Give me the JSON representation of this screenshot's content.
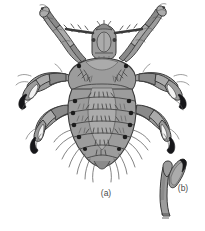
{
  "figure": {
    "kind": "scientific-illustration",
    "background_color": "#ffffff",
    "panels": [
      {
        "id": "a",
        "label": "(a)",
        "caption_x": 106,
        "caption_y": 196,
        "content": "whole louse, dorsal view"
      },
      {
        "id": "b",
        "label": "(b)",
        "caption_x": 183,
        "caption_y": 191,
        "content": "tarsal claw, enlarged"
      }
    ],
    "palette": {
      "body_fill": "#9c9c9c",
      "body_fill_light": "#ababab",
      "body_fill_dark": "#8a8a8a",
      "segment_shade": "#7f7f7f",
      "outline": "#3a3a3a",
      "bristle": "#5a5a5a",
      "spiracle": "#1c1c1c",
      "claw_dark": "#17171a",
      "claw_highlight": "#f2f2f2",
      "label_text": "#4a4a4a"
    },
    "anatomy": {
      "head": {
        "label": "head capsule",
        "cx": 104,
        "cy": 42,
        "w": 22,
        "h": 24
      },
      "antennae": {
        "label": "antennae",
        "count": 2,
        "segments": 5
      },
      "thorax": {
        "label": "thorax",
        "cx": 102,
        "cy": 74
      },
      "abdomen": {
        "label": "abdomen",
        "cx": 102,
        "cy": 125,
        "segments": 6
      },
      "legs": [
        {
          "name": "foreleg-left",
          "pair": 1,
          "side": "left",
          "type": "slender"
        },
        {
          "name": "foreleg-right",
          "pair": 1,
          "side": "right",
          "type": "slender"
        },
        {
          "name": "midleg-left",
          "pair": 2,
          "side": "left",
          "type": "grasping-claw"
        },
        {
          "name": "midleg-right",
          "pair": 2,
          "side": "right",
          "type": "grasping-claw"
        },
        {
          "name": "hindleg-left",
          "pair": 3,
          "side": "left",
          "type": "grasping-claw"
        },
        {
          "name": "hindleg-right",
          "pair": 3,
          "side": "right",
          "type": "grasping-claw"
        }
      ],
      "spiracles": {
        "label": "spiracles",
        "count": 12,
        "color": "#1c1c1c"
      },
      "bristles": {
        "label": "marginal bristles",
        "color": "#5a5a5a"
      }
    }
  }
}
